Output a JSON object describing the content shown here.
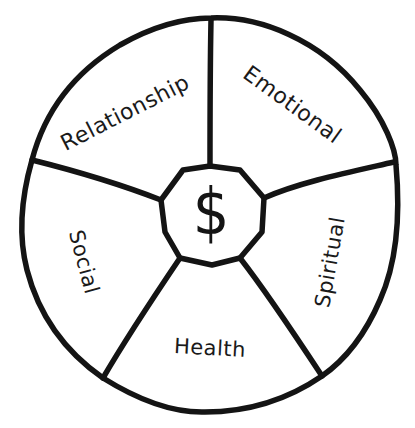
{
  "diagram": {
    "type": "wheel",
    "center": {
      "symbol": "$",
      "icon": "dollar-sign"
    },
    "segments": [
      {
        "id": "relationship",
        "label": "Relationship"
      },
      {
        "id": "emotional",
        "label": "Emotional"
      },
      {
        "id": "spiritual",
        "label": "Spiritual"
      },
      {
        "id": "health",
        "label": "Health"
      },
      {
        "id": "social",
        "label": "Social"
      }
    ],
    "colors": {
      "stroke": "#141414",
      "background": "#ffffff",
      "text": "#1a1a1a"
    }
  }
}
